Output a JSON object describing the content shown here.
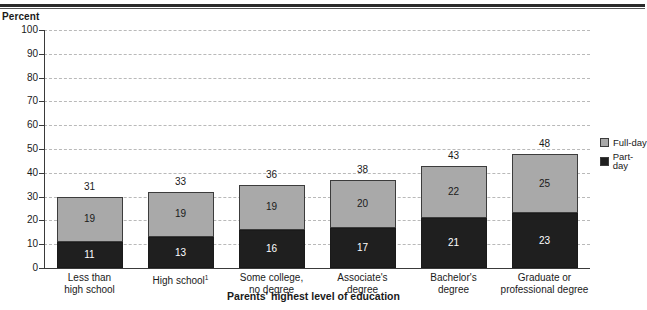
{
  "chart_data": {
    "type": "bar",
    "subtype": "stacked-bar",
    "title": "",
    "xlabel": "Parents' highest level of education",
    "ylabel": "Percent",
    "ylim": [
      0,
      100
    ],
    "yticks": [
      "0",
      "10",
      "20",
      "30",
      "40",
      "50",
      "60",
      "70",
      "80",
      "90",
      "100"
    ],
    "grid": "horizontal-dashed",
    "legend_position": "right",
    "categories": [
      "Less than high school",
      "High school",
      "Some college, no degree",
      "Associate's degree",
      "Bachelor's degree",
      "Graduate or professional degree"
    ],
    "category_lines": [
      [
        "Less than",
        "high school"
      ],
      [
        "High school",
        ""
      ],
      [
        "Some college,",
        "no degree"
      ],
      [
        "Associate's",
        "degree"
      ],
      [
        "Bachelor's",
        "degree"
      ],
      [
        "Graduate or",
        "professional degree"
      ]
    ],
    "category_footnotes": [
      "",
      "1",
      "",
      "",
      "",
      ""
    ],
    "series": [
      {
        "name": "Part-day",
        "color": "#1f1f1f",
        "values": [
          11,
          13,
          16,
          17,
          21,
          23
        ]
      },
      {
        "name": "Full-day",
        "color": "#a9a9a9",
        "values": [
          19,
          19,
          19,
          20,
          22,
          25
        ]
      }
    ],
    "totals": [
      31,
      33,
      36,
      38,
      43,
      48
    ],
    "stack_order_bottom_to_top": [
      "Part-day",
      "Full-day"
    ]
  },
  "legend": {
    "items": [
      {
        "label": "Full-day",
        "color": "#a9a9a9"
      },
      {
        "label": "Part-day",
        "color": "#1f1f1f"
      }
    ]
  },
  "axis": {
    "y_title": "Percent",
    "x_title": "Parents' highest level of education"
  }
}
